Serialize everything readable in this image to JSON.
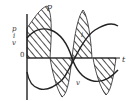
{
  "diagram": {
    "title": "",
    "axes": {
      "vertical_labels": [
        "p",
        "i",
        "v"
      ],
      "origin_label": "0",
      "horizontal_label": "t"
    },
    "curves": [
      {
        "name": "p",
        "label": "p",
        "description": "instantaneous power, hatched regions above and below axis"
      },
      {
        "name": "i",
        "label": "i",
        "description": "current sinusoid"
      },
      {
        "name": "v",
        "label": "v",
        "description": "voltage sinusoid"
      }
    ],
    "colors": {
      "ink": "#222222",
      "background": "#ffffff"
    }
  }
}
